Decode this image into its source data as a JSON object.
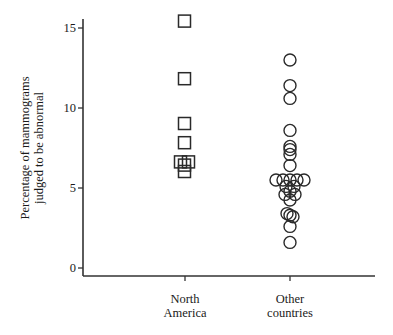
{
  "chart_data": {
    "type": "scatter",
    "title": "",
    "xlabel": "",
    "ylabel": "Percentage of mammograms judged to be abnormal",
    "ylabel_lines": [
      "Percentage of mammograms",
      "judged to be abnormal"
    ],
    "ylim": [
      0,
      15.5
    ],
    "yticks": [
      0,
      5,
      10,
      15
    ],
    "grid": false,
    "legend": null,
    "categories": [
      "North America",
      "Other countries"
    ],
    "category_lines": [
      [
        "North",
        "America"
      ],
      [
        "Other",
        "countries"
      ]
    ],
    "series": [
      {
        "name": "North America",
        "marker": "square",
        "points": [
          {
            "value": 15.4,
            "dx": 0
          },
          {
            "value": 11.8,
            "dx": 0
          },
          {
            "value": 9.0,
            "dx": 0
          },
          {
            "value": 7.8,
            "dx": 0
          },
          {
            "value": 6.6,
            "dx": -4
          },
          {
            "value": 6.6,
            "dx": 4
          },
          {
            "value": 6.4,
            "dx": 0
          },
          {
            "value": 6.0,
            "dx": 0
          }
        ]
      },
      {
        "name": "Other countries",
        "marker": "circle",
        "points": [
          {
            "value": 13.0,
            "dx": 0
          },
          {
            "value": 11.4,
            "dx": 0
          },
          {
            "value": 10.6,
            "dx": 0
          },
          {
            "value": 8.6,
            "dx": 0
          },
          {
            "value": 7.6,
            "dx": 0
          },
          {
            "value": 7.4,
            "dx": 0
          },
          {
            "value": 7.1,
            "dx": 0
          },
          {
            "value": 6.4,
            "dx": 0
          },
          {
            "value": 5.5,
            "dx": -14
          },
          {
            "value": 5.5,
            "dx": -7
          },
          {
            "value": 5.5,
            "dx": 0
          },
          {
            "value": 5.5,
            "dx": 7
          },
          {
            "value": 5.5,
            "dx": 14
          },
          {
            "value": 5.1,
            "dx": -4
          },
          {
            "value": 5.1,
            "dx": 4
          },
          {
            "value": 4.8,
            "dx": 0
          },
          {
            "value": 4.6,
            "dx": -5
          },
          {
            "value": 4.6,
            "dx": 5
          },
          {
            "value": 4.25,
            "dx": 0
          },
          {
            "value": 3.4,
            "dx": -3
          },
          {
            "value": 3.2,
            "dx": 3
          },
          {
            "value": 3.3,
            "dx": 0
          },
          {
            "value": 2.6,
            "dx": 0
          },
          {
            "value": 1.6,
            "dx": 0
          }
        ]
      }
    ]
  },
  "layout": {
    "plot_left": 83,
    "plot_right": 375,
    "axis_bottom_y": 276,
    "axis_top_y": 19,
    "y0_px": 268,
    "px_per_unit": 16,
    "category_x": [
      185,
      290
    ],
    "marker_size": 13,
    "colors": {
      "axis": "#333333",
      "marker": "#2a2a2a",
      "background": "#ffffff"
    }
  }
}
